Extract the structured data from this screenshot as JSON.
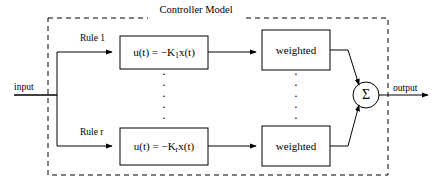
{
  "diagram": {
    "title": "Controller Model",
    "colors": {
      "stroke": "#000000",
      "background": "#ffffff",
      "boundary": "#000000"
    },
    "io": {
      "input_label": "input",
      "output_label": "output"
    },
    "rows": [
      {
        "rule_label": "Rule 1",
        "law_prefix": "u(t) = −K",
        "law_subscript": "1",
        "law_suffix": "x(t)",
        "weighted_label": "weighted"
      },
      {
        "rule_label": "Rule r",
        "law_prefix": "u(t) = −K",
        "law_subscript": "r",
        "law_suffix": "x(t)",
        "weighted_label": "weighted"
      }
    ],
    "summation": {
      "symbol": "Σ"
    },
    "ellipsis": {
      "glyph": "·",
      "count": 5,
      "columns": [
        "rule-column",
        "weighted-column"
      ]
    },
    "boundary": {
      "style": "dashed",
      "label_position": "top-center"
    }
  }
}
